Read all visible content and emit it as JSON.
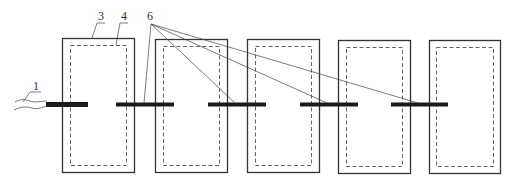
{
  "diagram": {
    "type": "technical schematic",
    "labels": [
      {
        "id": "1",
        "text": "1",
        "refers_to": "input wire / cable",
        "x": 36,
        "y": 90
      },
      {
        "id": "3",
        "text": "3",
        "refers_to": "outer frame (solid)",
        "x": 101,
        "y": 20
      },
      {
        "id": "4",
        "text": "4",
        "refers_to": "inner frame (dashed)",
        "x": 124,
        "y": 20
      },
      {
        "id": "6",
        "text": "6",
        "refers_to": "connecting bars",
        "x": 150,
        "y": 20
      }
    ],
    "units": [
      {
        "index": 1,
        "outer": {
          "x": 62,
          "y": 38,
          "w": 72,
          "h": 134
        },
        "inner": {
          "x": 70,
          "y": 45,
          "w": 56,
          "h": 120
        }
      },
      {
        "index": 2,
        "outer": {
          "x": 155,
          "y": 39,
          "w": 72,
          "h": 133
        },
        "inner": {
          "x": 163,
          "y": 46,
          "w": 56,
          "h": 119
        }
      },
      {
        "index": 3,
        "outer": {
          "x": 247,
          "y": 39,
          "w": 72,
          "h": 133
        },
        "inner": {
          "x": 255,
          "y": 46,
          "w": 56,
          "h": 119
        }
      },
      {
        "index": 4,
        "outer": {
          "x": 338,
          "y": 40,
          "w": 72,
          "h": 133
        },
        "inner": {
          "x": 346,
          "y": 47,
          "w": 56,
          "h": 119
        }
      },
      {
        "index": 5,
        "outer": {
          "x": 429,
          "y": 40,
          "w": 71,
          "h": 133
        },
        "inner": {
          "x": 436,
          "y": 47,
          "w": 57,
          "h": 119
        }
      }
    ],
    "bars": [
      {
        "index": 1,
        "x1": 46,
        "x2": 88,
        "y": 104.5,
        "thickness": 5
      },
      {
        "index": 2,
        "x1": 116,
        "x2": 174,
        "y": 104.5,
        "thickness": 4
      },
      {
        "index": 3,
        "x1": 208,
        "x2": 266,
        "y": 104.5,
        "thickness": 4
      },
      {
        "index": 4,
        "x1": 300,
        "x2": 358,
        "y": 104.5,
        "thickness": 4
      },
      {
        "index": 5,
        "x1": 391,
        "x2": 448,
        "y": 104.5,
        "thickness": 4
      }
    ],
    "colors": {
      "line": "#333333",
      "bar": "#1a1a1a",
      "background": "#ffffff"
    }
  }
}
